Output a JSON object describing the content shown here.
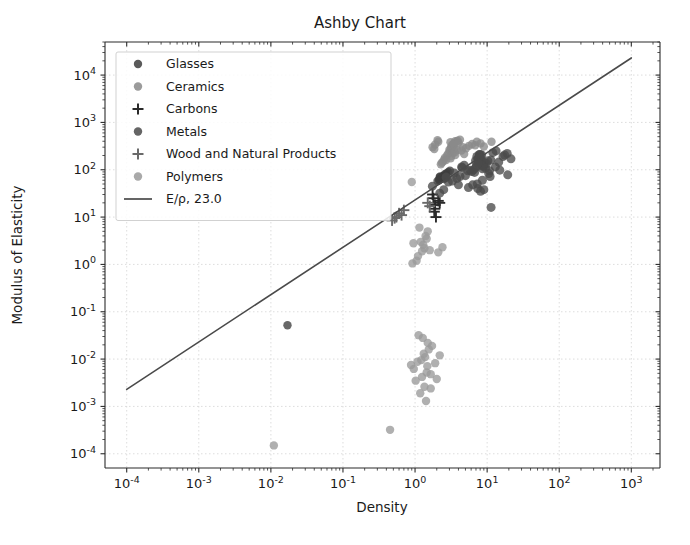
{
  "chart_data": {
    "type": "scatter",
    "title": "Ashby Chart",
    "xlabel": "Density",
    "ylabel": "Modulus of Elasticity",
    "xscale": "log",
    "yscale": "log",
    "xlim": [
      5e-05,
      2500
    ],
    "ylim": [
      5e-05,
      50000
    ],
    "grid": true,
    "legend_position": "upper left",
    "xticks": [
      {
        "value": 0.0001,
        "label_base": "10",
        "label_exp": "-4"
      },
      {
        "value": 0.001,
        "label_base": "10",
        "label_exp": "-3"
      },
      {
        "value": 0.01,
        "label_base": "10",
        "label_exp": "-2"
      },
      {
        "value": 0.1,
        "label_base": "10",
        "label_exp": "-1"
      },
      {
        "value": 1,
        "label_base": "10",
        "label_exp": "0"
      },
      {
        "value": 10,
        "label_base": "10",
        "label_exp": "1"
      },
      {
        "value": 100,
        "label_base": "10",
        "label_exp": "2"
      },
      {
        "value": 1000,
        "label_base": "10",
        "label_exp": "3"
      }
    ],
    "yticks": [
      {
        "value": 0.0001,
        "label_base": "10",
        "label_exp": "-4"
      },
      {
        "value": 0.001,
        "label_base": "10",
        "label_exp": "-3"
      },
      {
        "value": 0.01,
        "label_base": "10",
        "label_exp": "-2"
      },
      {
        "value": 0.1,
        "label_base": "10",
        "label_exp": "-1"
      },
      {
        "value": 1,
        "label_base": "10",
        "label_exp": "0"
      },
      {
        "value": 10,
        "label_base": "10",
        "label_exp": "1"
      },
      {
        "value": 100,
        "label_base": "10",
        "label_exp": "2"
      },
      {
        "value": 1000,
        "label_base": "10",
        "label_exp": "3"
      },
      {
        "value": 10000,
        "label_base": "10",
        "label_exp": "4"
      }
    ],
    "series": [
      {
        "name": "Glasses",
        "marker": "circle",
        "color": "#3d3d3d",
        "size": 4.2,
        "points": [
          [
            2.2,
            70
          ],
          [
            2.23,
            72
          ],
          [
            2.45,
            74
          ],
          [
            2.5,
            68
          ],
          [
            2.52,
            64
          ],
          [
            2.18,
            62
          ],
          [
            2.6,
            81
          ],
          [
            2.9,
            90
          ],
          [
            2.3,
            66
          ],
          [
            2.4,
            71
          ],
          [
            2.05,
            58
          ],
          [
            3.05,
            95
          ],
          [
            2.15,
            60
          ],
          [
            2.65,
            77
          ],
          [
            2.75,
            85
          ],
          [
            0.017,
            0.052
          ]
        ]
      },
      {
        "name": "Ceramics",
        "marker": "circle",
        "color": "#8a8a8a",
        "size": 4.2,
        "points": [
          [
            3.2,
            300
          ],
          [
            3.1,
            380
          ],
          [
            3.9,
            410
          ],
          [
            3.25,
            330
          ],
          [
            3.5,
            280
          ],
          [
            3.05,
            250
          ],
          [
            2.9,
            220
          ],
          [
            3.4,
            355
          ],
          [
            3.15,
            290
          ],
          [
            3.6,
            400
          ],
          [
            4.2,
            430
          ],
          [
            2.6,
            180
          ],
          [
            3.35,
            310
          ],
          [
            3.75,
            390
          ],
          [
            3.0,
            265
          ],
          [
            5.6,
            320
          ],
          [
            6.2,
            350
          ],
          [
            2.55,
            165
          ],
          [
            3.45,
            345
          ],
          [
            4.0,
            370
          ],
          [
            3.3,
            225
          ],
          [
            2.8,
            205
          ],
          [
            3.85,
            260
          ],
          [
            4.6,
            300
          ],
          [
            3.18,
            195
          ],
          [
            7.2,
            390
          ],
          [
            2.45,
            150
          ],
          [
            5.1,
            285
          ],
          [
            3.55,
            235
          ],
          [
            6.8,
            330
          ],
          [
            2.35,
            140
          ],
          [
            4.4,
            255
          ],
          [
            3.12,
            175
          ],
          [
            8.1,
            360
          ],
          [
            2.7,
            160
          ],
          [
            11.5,
            390
          ],
          [
            2.28,
            130
          ],
          [
            4.8,
            215
          ],
          [
            3.62,
            205
          ],
          [
            9.0,
            310
          ],
          [
            1.9,
            340
          ],
          [
            2.1,
            390
          ],
          [
            1.75,
            300
          ],
          [
            2.05,
            420
          ],
          [
            1.85,
            275
          ]
        ]
      },
      {
        "name": "Carbons",
        "marker": "plus",
        "color": "#2a2a2a",
        "size": 5.5,
        "points": [
          [
            1.8,
            25
          ],
          [
            1.9,
            18
          ],
          [
            1.85,
            13
          ],
          [
            2.1,
            22
          ],
          [
            1.95,
            10
          ],
          [
            2.2,
            20
          ],
          [
            1.75,
            30
          ],
          [
            1.88,
            15
          ]
        ]
      },
      {
        "name": "Metals",
        "marker": "circle",
        "color": "#4a4a4a",
        "size": 4.5,
        "points": [
          [
            7.8,
            200
          ],
          [
            7.9,
            210
          ],
          [
            8.0,
            195
          ],
          [
            2.7,
            70
          ],
          [
            4.5,
            110
          ],
          [
            8.9,
            130
          ],
          [
            7.2,
            190
          ],
          [
            11.3,
            160
          ],
          [
            8.4,
            205
          ],
          [
            7.1,
            120
          ],
          [
            4.43,
            115
          ],
          [
            1.74,
            45
          ],
          [
            2.7,
            69
          ],
          [
            8.96,
            120
          ],
          [
            19.3,
            78
          ],
          [
            10.5,
            83
          ],
          [
            7.87,
            211
          ],
          [
            21.4,
            170
          ],
          [
            6.5,
            100
          ],
          [
            9.8,
            135
          ],
          [
            5.4,
            95
          ],
          [
            8.65,
            105
          ],
          [
            7.3,
            50
          ],
          [
            11.34,
            16
          ],
          [
            6.7,
            88
          ],
          [
            4.8,
            125
          ],
          [
            8.55,
            145
          ],
          [
            7.6,
            180
          ],
          [
            13.3,
            250
          ],
          [
            16.6,
            190
          ],
          [
            8.2,
            175
          ],
          [
            9.2,
            142
          ],
          [
            5.8,
            98
          ],
          [
            7.45,
            165
          ],
          [
            10.2,
            155
          ],
          [
            6.1,
            92
          ],
          [
            8.75,
            118
          ],
          [
            12.0,
            230
          ],
          [
            7.0,
            112
          ],
          [
            3.5,
            85
          ],
          [
            8.3,
            128
          ],
          [
            9.5,
            108
          ],
          [
            6.9,
            155
          ],
          [
            7.55,
            138
          ],
          [
            5.0,
            75
          ],
          [
            4.2,
            72
          ],
          [
            3.8,
            65
          ],
          [
            2.9,
            55
          ],
          [
            8.6,
            60
          ],
          [
            10.8,
            95
          ],
          [
            7.4,
            40
          ],
          [
            6.3,
            48
          ],
          [
            9.0,
            38
          ],
          [
            11.0,
            72
          ],
          [
            5.5,
            42
          ],
          [
            13.0,
            115
          ],
          [
            14.5,
            145
          ],
          [
            8.1,
            35
          ],
          [
            4.0,
            48
          ],
          [
            3.3,
            58
          ],
          [
            2.5,
            38
          ],
          [
            2.2,
            32
          ],
          [
            19.0,
            220
          ],
          [
            17.5,
            205
          ],
          [
            15.0,
            98
          ]
        ]
      },
      {
        "name": "Wood and Natural Products",
        "marker": "plus",
        "color": "#6a6a6a",
        "size": 5.5,
        "points": [
          [
            0.55,
            10
          ],
          [
            0.6,
            12
          ],
          [
            0.7,
            14
          ],
          [
            0.48,
            8.5
          ],
          [
            0.65,
            11
          ],
          [
            1.5,
            20
          ],
          [
            1.6,
            17
          ],
          [
            0.52,
            9.5
          ]
        ]
      },
      {
        "name": "Polymers",
        "marker": "circle",
        "color": "#9a9a9a",
        "size": 4.2,
        "points": [
          [
            1.2,
            3.0
          ],
          [
            1.3,
            2.6
          ],
          [
            1.4,
            4.0
          ],
          [
            1.25,
            1.9
          ],
          [
            1.35,
            2.2
          ],
          [
            1.1,
            1.5
          ],
          [
            1.45,
            3.5
          ],
          [
            1.05,
            1.2
          ],
          [
            1.5,
            5.0
          ],
          [
            0.95,
            2.8
          ],
          [
            1.6,
            2.0
          ],
          [
            0.92,
            1.05
          ],
          [
            1.15,
            6.0
          ],
          [
            2.1,
            1.8
          ],
          [
            2.4,
            2.3
          ],
          [
            1.28,
            0.028
          ],
          [
            1.5,
            0.022
          ],
          [
            1.32,
            0.013
          ],
          [
            1.38,
            0.011
          ],
          [
            1.22,
            0.0095
          ],
          [
            1.9,
            0.0082
          ],
          [
            1.55,
            0.016
          ],
          [
            0.88,
            0.0075
          ],
          [
            1.25,
            0.0042
          ],
          [
            2.0,
            0.0038
          ],
          [
            1.45,
            0.0052
          ],
          [
            1.35,
            0.0026
          ],
          [
            1.18,
            0.0019
          ],
          [
            1.42,
            0.0013
          ],
          [
            0.45,
            0.00032
          ],
          [
            0.011,
            0.00015
          ],
          [
            1.72,
            0.019
          ],
          [
            1.12,
            0.032
          ],
          [
            0.96,
            0.0062
          ],
          [
            1.65,
            0.0048
          ],
          [
            1.08,
            0.0088
          ],
          [
            2.2,
            0.012
          ],
          [
            1.48,
            0.0071
          ],
          [
            1.02,
            0.0035
          ],
          [
            0.9,
            55
          ],
          [
            1.65,
            0.0024
          ]
        ]
      }
    ],
    "reference_line": {
      "label": "E/ρ, 23.0",
      "color": "#4a4a4a",
      "slope": 1,
      "ratio": 23.0,
      "x_start": 0.0001,
      "x_end": 1000
    },
    "legend_entries": [
      {
        "label": "Glasses",
        "marker": "circle",
        "color": "#3d3d3d"
      },
      {
        "label": "Ceramics",
        "marker": "circle",
        "color": "#8a8a8a"
      },
      {
        "label": "Carbons",
        "marker": "plus",
        "color": "#2a2a2a"
      },
      {
        "label": "Metals",
        "marker": "circle",
        "color": "#4a4a4a"
      },
      {
        "label": "Wood and Natural Products",
        "marker": "plus",
        "color": "#6a6a6a"
      },
      {
        "label": "Polymers",
        "marker": "circle",
        "color": "#9a9a9a"
      },
      {
        "label": "E/ρ, 23.0",
        "marker": "line",
        "color": "#4a4a4a"
      }
    ]
  }
}
